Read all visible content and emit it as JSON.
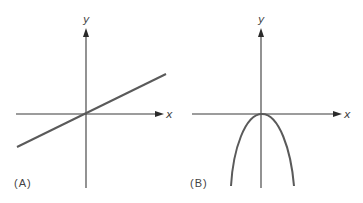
{
  "panels": [
    {
      "id": "A",
      "label": "(A)",
      "x_axis_label": "x",
      "y_axis_label": "y",
      "curve": "line",
      "description": "Straight line with positive slope through the origin"
    },
    {
      "id": "B",
      "label": "(B)",
      "x_axis_label": "x",
      "y_axis_label": "y",
      "curve": "downward parabola",
      "description": "Downward-opening parabola with vertex at the origin"
    }
  ],
  "colors": {
    "axis": "#3a3a3a",
    "curve": "#5a5a5a",
    "text": "#444444",
    "background": "#ffffff"
  }
}
